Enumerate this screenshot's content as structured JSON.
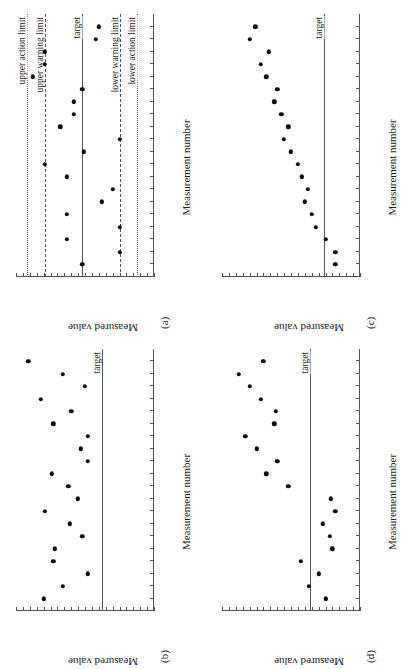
{
  "figure": {
    "orientation": "rotated-90-ccw",
    "marker_color": "#0d0d0d",
    "axis_color": "#555555"
  },
  "labels": {
    "xlabel": "Measurement number",
    "ylabel": "Measured value",
    "target": "target",
    "upper_action_limit": "upper action limit",
    "upper_warning_limit": "upper warning limit",
    "lower_warning_limit": "lower warning limit",
    "lower_action_limit": "lower action limit",
    "tag_a": "(a)",
    "tag_b": "(b)",
    "tag_c": "(c)",
    "tag_d": "(d)"
  },
  "chart_data": [
    {
      "panel": "(a)",
      "type": "scatter",
      "title": "",
      "xlabel": "Measurement number",
      "ylabel": "Measured value",
      "xlim": [
        0,
        21
      ],
      "ylim": [
        0,
        100
      ],
      "grid": false,
      "legend": "none",
      "reflines": [
        {
          "name": "upper action limit",
          "value": 92,
          "style": "dotted",
          "label": "upper action limit"
        },
        {
          "name": "upper warning limit",
          "value": 79,
          "style": "dashed",
          "label": "upper warning limit"
        },
        {
          "name": "target",
          "value": 52,
          "style": "solid",
          "label": "target"
        },
        {
          "name": "lower warning limit",
          "value": 25,
          "style": "dashed",
          "label": "lower warning limit"
        },
        {
          "name": "lower action limit",
          "value": 12,
          "style": "dotted",
          "label": "lower action limit"
        }
      ],
      "x": [
        1,
        2,
        3,
        4,
        5,
        6,
        7,
        8,
        9,
        10,
        11,
        12,
        13,
        14,
        15,
        16,
        17,
        18,
        19,
        20
      ],
      "values": [
        52,
        25,
        63,
        25,
        63,
        38,
        30,
        63,
        79,
        51,
        25,
        68,
        58,
        58,
        52,
        88,
        79,
        79,
        42,
        40
      ]
    },
    {
      "panel": "(b)",
      "type": "scatter",
      "title": "",
      "xlabel": "Measurement number",
      "ylabel": "Measured value",
      "xlim": [
        0,
        21
      ],
      "ylim": [
        0,
        100
      ],
      "grid": false,
      "legend": "none",
      "reflines": [
        {
          "name": "target",
          "value": 38,
          "style": "solid",
          "label": "target"
        }
      ],
      "x": [
        1,
        2,
        3,
        4,
        5,
        6,
        7,
        8,
        9,
        10,
        11,
        12,
        13,
        14,
        15,
        16,
        17,
        18,
        19,
        20
      ],
      "values": [
        80,
        66,
        48,
        73,
        72,
        52,
        61,
        79,
        55,
        62,
        74,
        48,
        53,
        48,
        73,
        60,
        82,
        50,
        66,
        91
      ]
    },
    {
      "panel": "(c)",
      "type": "scatter",
      "title": "",
      "xlabel": "Measurement number",
      "ylabel": "Measured value",
      "xlim": [
        0,
        21
      ],
      "ylim": [
        0,
        100
      ],
      "grid": false,
      "legend": "none",
      "reflines": [
        {
          "name": "target",
          "value": 26,
          "style": "solid",
          "label": "target"
        }
      ],
      "x": [
        1,
        2,
        3,
        4,
        5,
        6,
        7,
        8,
        9,
        10,
        11,
        12,
        13,
        14,
        15,
        16,
        17,
        18,
        19,
        20
      ],
      "values": [
        18,
        18,
        25,
        32,
        35,
        40,
        38,
        42,
        45,
        50,
        55,
        52,
        57,
        62,
        60,
        68,
        72,
        66,
        80,
        76
      ]
    },
    {
      "panel": "(d)",
      "type": "scatter",
      "title": "",
      "xlabel": "Measurement number",
      "ylabel": "Measured value",
      "xlim": [
        0,
        21
      ],
      "ylim": [
        0,
        100
      ],
      "grid": false,
      "legend": "none",
      "reflines": [
        {
          "name": "target",
          "value": 36,
          "style": "solid",
          "label": "target"
        }
      ],
      "x": [
        1,
        2,
        3,
        4,
        5,
        6,
        7,
        8,
        9,
        10,
        11,
        12,
        13,
        14,
        15,
        16,
        17,
        18,
        19,
        20
      ],
      "values": [
        25,
        37,
        30,
        43,
        20,
        22,
        27,
        18,
        21,
        52,
        68,
        60,
        75,
        83,
        62,
        61,
        72,
        80,
        88,
        70
      ]
    }
  ]
}
